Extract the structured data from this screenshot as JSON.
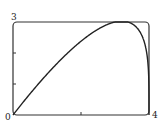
{
  "chart_data": {
    "type": "line",
    "title": "",
    "xlabel": "",
    "ylabel": "",
    "xlim": [
      0,
      4
    ],
    "ylim": [
      0,
      3
    ],
    "grid": false,
    "legend": null,
    "tick_labels": {
      "x_min": "0",
      "x_max": "4",
      "y_max": "3"
    },
    "x_ticks": [
      0,
      2,
      4
    ],
    "y_ticks": [
      0,
      1,
      2,
      3
    ],
    "series": [
      {
        "name": "y = x(4-x)^(1/4)",
        "x": [
          0,
          0.5,
          1,
          1.5,
          2,
          2.5,
          3,
          3.2,
          3.5,
          3.8,
          3.95,
          4
        ],
        "y": [
          0,
          0.68,
          1.32,
          1.89,
          2.38,
          2.77,
          3.0,
          3.03,
          2.94,
          2.55,
          1.86,
          0
        ]
      }
    ]
  }
}
